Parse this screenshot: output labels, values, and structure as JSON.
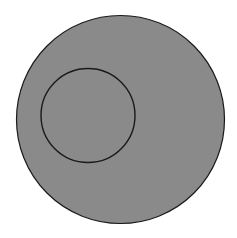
{
  "diagram": {
    "type": "nested-circles",
    "background_color": "#ffffff",
    "outer_circle": {
      "cx": 120.5,
      "cy": 119.5,
      "r": 104,
      "fill": "#8a8a8a",
      "stroke": "#1a1a1a",
      "stroke_width": 1.2
    },
    "inner_circle": {
      "cx": 88,
      "cy": 115.5,
      "r": 47,
      "fill": "none",
      "stroke": "#1a1a1a",
      "stroke_width": 1.4
    }
  }
}
